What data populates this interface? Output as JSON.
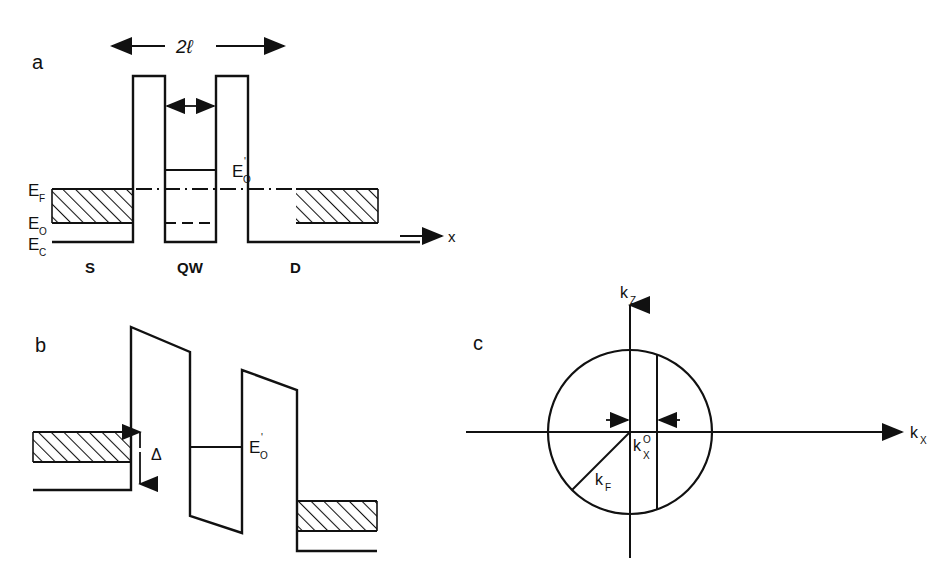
{
  "figure": {
    "background": "#ffffff",
    "ink": "#111111"
  },
  "panels": [
    {
      "id": "a",
      "letter": "a",
      "name": "equilibrium-band-diagram",
      "labels": {
        "width_dimension": "2ℓ",
        "barrier_gap_dimension": "t",
        "fermi_level": "E",
        "fermi_level_sub": "F",
        "subband_level": "E",
        "subband_level_sub": "O",
        "conduction_band": "E",
        "conduction_band_sub": "C",
        "well_level": "E",
        "well_level_sub": "O",
        "well_level_prime": "'",
        "region_source": "S",
        "region_well": "QW",
        "region_drain": "D",
        "axis_x": "x"
      }
    },
    {
      "id": "b",
      "letter": "b",
      "name": "biased-band-diagram",
      "labels": {
        "delta": "Δ",
        "well_level": "E",
        "well_level_sub": "O",
        "well_level_prime": "'"
      }
    },
    {
      "id": "c",
      "letter": "c",
      "name": "fermi-circle-diagram",
      "labels": {
        "axis_kz": "k",
        "axis_kz_sub": "Z",
        "axis_kx": "k",
        "axis_kx_sub": "X",
        "fermi_wavevector": "k",
        "fermi_wavevector_sub": "F",
        "kx_zero": "k",
        "kx_zero_sub": "X",
        "kx_zero_sup": "O"
      }
    }
  ]
}
